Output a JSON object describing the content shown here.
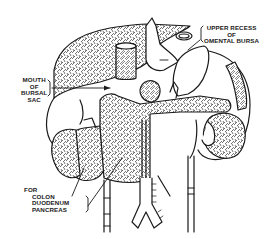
{
  "figure": {
    "type": "anatomical line drawing",
    "colors": {
      "ink": "#1a1a1a",
      "background": "#ffffff",
      "hatch": "#3a3a3a"
    }
  },
  "labels": {
    "upper_recess": {
      "lines": [
        "UPPER RECESS",
        "OF",
        "OMENTAL BURSA"
      ]
    },
    "mouth_bursal_sac": {
      "lines": [
        "MOUTH",
        "OF",
        "BURSAL",
        "SAC"
      ]
    },
    "for_structures": {
      "lines": [
        "FOR",
        "COLON",
        "DUODENUM",
        "PANCREAS"
      ]
    }
  }
}
